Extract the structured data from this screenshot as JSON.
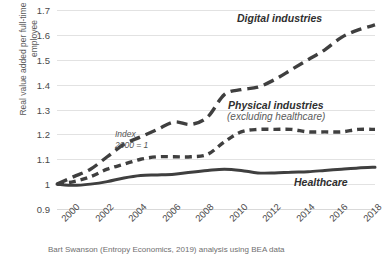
{
  "chart_data": {
    "type": "line",
    "title": "",
    "xlabel": "",
    "ylabel": "Real value added per full-time equivalent employee",
    "ylim": [
      0.9,
      1.7
    ],
    "yticks": [
      "1.7",
      "1.6",
      "1.5",
      "1.4",
      "1.3",
      "1.2",
      "1.1",
      "1",
      "0.9"
    ],
    "ytick_values": [
      1.7,
      1.6,
      1.5,
      1.4,
      1.3,
      1.2,
      1.1,
      1.0,
      0.9
    ],
    "grid": "horizontal",
    "legend_position": "inline-labels",
    "xlim": [
      2000,
      2019
    ],
    "xticks": [
      "2000",
      "2002",
      "2004",
      "2006",
      "2008",
      "2010",
      "2012",
      "2014",
      "2016",
      "2018"
    ],
    "xtick_values": [
      2000,
      2002,
      2004,
      2006,
      2008,
      2010,
      2012,
      2014,
      2016,
      2018
    ],
    "x": [
      2000,
      2001,
      2002,
      2003,
      2004,
      2005,
      2006,
      2007,
      2008,
      2009,
      2010,
      2011,
      2012,
      2013,
      2014,
      2015,
      2016,
      2017,
      2018,
      2019
    ],
    "series": [
      {
        "name": "Digital industries",
        "style": "long-dash",
        "color": "#3f3f3f",
        "values": [
          1.0,
          1.03,
          1.06,
          1.11,
          1.16,
          1.19,
          1.22,
          1.25,
          1.24,
          1.27,
          1.36,
          1.38,
          1.39,
          1.42,
          1.46,
          1.5,
          1.54,
          1.59,
          1.62,
          1.64
        ]
      },
      {
        "name": "Physical industries (excluding healthcare)",
        "style": "short-dash",
        "color": "#3f3f3f",
        "values": [
          1.0,
          1.01,
          1.03,
          1.06,
          1.08,
          1.1,
          1.11,
          1.11,
          1.11,
          1.12,
          1.17,
          1.21,
          1.22,
          1.22,
          1.22,
          1.21,
          1.21,
          1.21,
          1.22,
          1.22
        ]
      },
      {
        "name": "Healthcare",
        "style": "solid",
        "color": "#3f3f3f",
        "values": [
          1.0,
          0.995,
          1.0,
          1.01,
          1.025,
          1.035,
          1.037,
          1.04,
          1.048,
          1.055,
          1.06,
          1.055,
          1.045,
          1.045,
          1.048,
          1.05,
          1.055,
          1.06,
          1.065,
          1.068
        ]
      }
    ],
    "annotations": [
      {
        "name": "index-note",
        "line1": "Index",
        "line2": "2000 = 1"
      }
    ],
    "series_labels": {
      "digital": "Digital industries",
      "physical": "Physical industries",
      "physical_sub": "(excluding healthcare)",
      "healthcare": "Healthcare"
    },
    "caption": "Bart Swanson (Entropy Economics, 2019) analysis using BEA data"
  }
}
